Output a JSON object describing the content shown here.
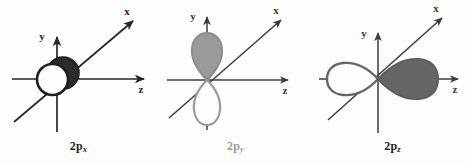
{
  "figure": {
    "background_color": "#fdfdfc",
    "width": 471,
    "height": 164,
    "panel_count": 3
  },
  "palette": {
    "axis_dark": "#262626",
    "axis_medium": "#5a5a5a",
    "lobe_dark_fill": "#2b2b2b",
    "lobe_dark_stroke": "#1f1f1f",
    "lobe_gray_fill": "#9a9a9a",
    "lobe_gray_stroke": "#8d8d8d",
    "lobe_mid_fill": "#666666",
    "lobe_mid_stroke": "#5c5c5c",
    "lobe_white_fill": "#fdfdfc",
    "caption_dark": "#1f1f1f",
    "caption_light": "#9a9a9a"
  },
  "panels": [
    {
      "id": "2px",
      "caption_base": "2p",
      "caption_sub": "x",
      "caption_full": "2p_x",
      "caption_color": "#1f1f1f",
      "axes": [
        {
          "name": "y",
          "label": "y",
          "direction": "up"
        },
        {
          "name": "z",
          "label": "z",
          "direction": "right"
        },
        {
          "name": "x",
          "label": "x",
          "direction": "upper-right-diagonal"
        }
      ],
      "orbital": {
        "orientation": "along-x",
        "view": "head-on",
        "lobe_shape": "circle",
        "lobes": [
          {
            "position": "front-lower-left",
            "fill": "white",
            "stroke": "dark"
          },
          {
            "position": "back-upper-right",
            "fill": "dark",
            "stroke": "dark"
          }
        ]
      }
    },
    {
      "id": "2py",
      "caption_base": "2p",
      "caption_sub": "y",
      "caption_full": "2p_y",
      "caption_color": "#9a9a9a",
      "axes": [
        {
          "name": "y",
          "label": "y",
          "direction": "up"
        },
        {
          "name": "z",
          "label": "z",
          "direction": "right"
        },
        {
          "name": "x",
          "label": "x",
          "direction": "upper-right-diagonal"
        }
      ],
      "orbital": {
        "orientation": "along-y",
        "view": "side-on",
        "lobe_shape": "teardrop",
        "lobes": [
          {
            "position": "upper",
            "fill": "gray",
            "stroke": "gray"
          },
          {
            "position": "lower",
            "fill": "white",
            "stroke": "gray"
          }
        ]
      }
    },
    {
      "id": "2pz",
      "caption_base": "2p",
      "caption_sub": "z",
      "caption_full": "2p_z",
      "caption_color": "#1f1f1f",
      "axes": [
        {
          "name": "y",
          "label": "y",
          "direction": "up"
        },
        {
          "name": "z",
          "label": "z",
          "direction": "right"
        },
        {
          "name": "x",
          "label": "x",
          "direction": "upper-right-diagonal"
        }
      ],
      "orbital": {
        "orientation": "along-z",
        "view": "side-on",
        "lobe_shape": "teardrop",
        "lobes": [
          {
            "position": "left",
            "fill": "white",
            "stroke": "mid"
          },
          {
            "position": "right",
            "fill": "mid",
            "stroke": "mid"
          }
        ]
      }
    }
  ]
}
